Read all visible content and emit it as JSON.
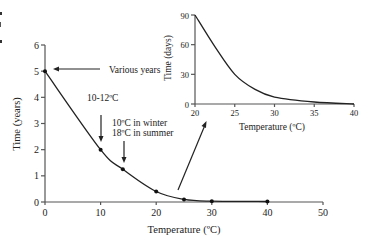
{
  "chart_data": [
    {
      "type": "line",
      "name": "main",
      "title": "",
      "xlabel": "Temperature (ºC)",
      "ylabel": "Time (years)",
      "xlim": [
        0,
        50
      ],
      "ylim": [
        0,
        6
      ],
      "x_ticks": [
        "0",
        "10",
        "20",
        "30",
        "40",
        "50"
      ],
      "y_ticks": [
        "0",
        "1",
        "2",
        "3",
        "4",
        "5",
        "6"
      ],
      "grid": false,
      "series": [
        {
          "name": "Time to death",
          "x": [
            0,
            10,
            14,
            20,
            25,
            30,
            40
          ],
          "y": [
            5,
            2,
            1.25,
            0.4,
            0.1,
            0.03,
            0.02
          ]
        }
      ],
      "annotations": [
        {
          "text": "Various years",
          "points_to": [
            0,
            5
          ]
        },
        {
          "text": "10-12ºC",
          "points_to": [
            10,
            2
          ]
        },
        {
          "text": "10ºC in winter",
          "points_to": [
            14,
            1.25
          ]
        },
        {
          "text": "18ºC in summer",
          "points_to": [
            14,
            1.25
          ]
        }
      ]
    },
    {
      "type": "line",
      "name": "inset",
      "title": "",
      "xlabel": "Temperature (ºC)",
      "ylabel": "Time (days)",
      "xlim": [
        20,
        40
      ],
      "ylim": [
        0,
        90
      ],
      "x_ticks": [
        "20",
        "25",
        "30",
        "35",
        "40"
      ],
      "y_ticks": [
        "0",
        "30",
        "60",
        "90"
      ],
      "grid": false,
      "series": [
        {
          "name": "Time to death (days)",
          "x": [
            20,
            22.5,
            25,
            27.5,
            30,
            35,
            40
          ],
          "y": [
            90,
            58,
            30,
            15,
            7,
            2,
            0
          ]
        }
      ]
    }
  ],
  "page_marks": [
    "•",
    "|",
    "•"
  ]
}
